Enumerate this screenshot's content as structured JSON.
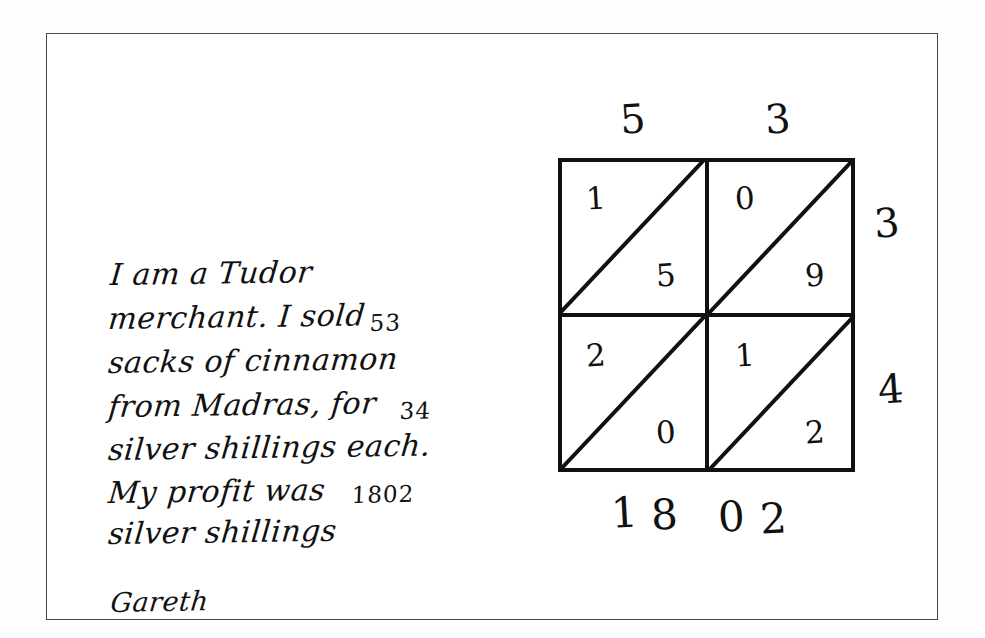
{
  "note": {
    "lines": [
      {
        "text": "I am a Tudor",
        "x": 2,
        "y": 40,
        "style": "main"
      },
      {
        "text": "merchant. I sold",
        "x": 0,
        "y": 84,
        "style": "main"
      },
      {
        "text": "53",
        "x": 262,
        "y": 80,
        "style": "num"
      },
      {
        "text": "sacks of cinnamon",
        "x": 0,
        "y": 128,
        "style": "main"
      },
      {
        "text": "from Madras, for",
        "x": 0,
        "y": 172,
        "style": "main"
      },
      {
        "text": "34",
        "x": 290,
        "y": 168,
        "style": "num"
      },
      {
        "text": "silver shillings each.",
        "x": 0,
        "y": 215,
        "style": "main"
      },
      {
        "text": "My profit was",
        "x": 0,
        "y": 258,
        "style": "main"
      },
      {
        "text": "1802",
        "x": 242,
        "y": 253,
        "style": "num"
      },
      {
        "text": "silver shillings",
        "x": 0,
        "y": 299,
        "style": "main"
      }
    ],
    "signature": "Gareth"
  },
  "lattice": {
    "top_labels": [
      "5",
      "3"
    ],
    "right_labels": [
      "3",
      "4"
    ],
    "cells": [
      {
        "position": "top-left",
        "upper": "1",
        "lower": "5",
        "product_of": "5 x 3"
      },
      {
        "position": "top-right",
        "upper": "0",
        "lower": "9",
        "product_of": "3 x 3"
      },
      {
        "position": "bottom-left",
        "upper": "2",
        "lower": "0",
        "product_of": "5 x 4"
      },
      {
        "position": "bottom-right",
        "upper": "1",
        "lower": "2",
        "product_of": "3 x 4"
      }
    ],
    "answer_digits": [
      "1",
      "8",
      "0",
      "2"
    ],
    "multiplicand": "53",
    "multiplier": "34",
    "product": "1802"
  },
  "colors": {
    "ink": "#111111",
    "frame": "#4a4a4a",
    "paper": "#ffffff"
  }
}
